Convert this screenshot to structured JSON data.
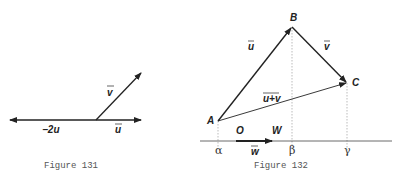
{
  "figures": [
    {
      "caption": "Figure 131",
      "labels": {
        "v": "v",
        "u": "u",
        "neg2u": "−2u"
      },
      "vectors": [
        {
          "name": "u",
          "from": [
            96,
            120
          ],
          "to": [
            143,
            120
          ]
        },
        {
          "name": "-2u",
          "from": [
            96,
            120
          ],
          "to": [
            8,
            120
          ]
        },
        {
          "name": "v",
          "from": [
            96,
            120
          ],
          "to": [
            142,
            72
          ]
        }
      ]
    },
    {
      "caption": "Figure 132",
      "points": {
        "A": "A",
        "B": "B",
        "C": "C",
        "O": "O",
        "W": "W"
      },
      "vector_labels": {
        "u": "u",
        "v": "v",
        "sum": "u+v",
        "w": "w"
      },
      "axis_labels": {
        "alpha": "α",
        "beta": "β",
        "gamma": "γ"
      }
    }
  ],
  "colors": {
    "line": "#222222",
    "dashed": "#aaaaaa",
    "caption": "#555555"
  }
}
